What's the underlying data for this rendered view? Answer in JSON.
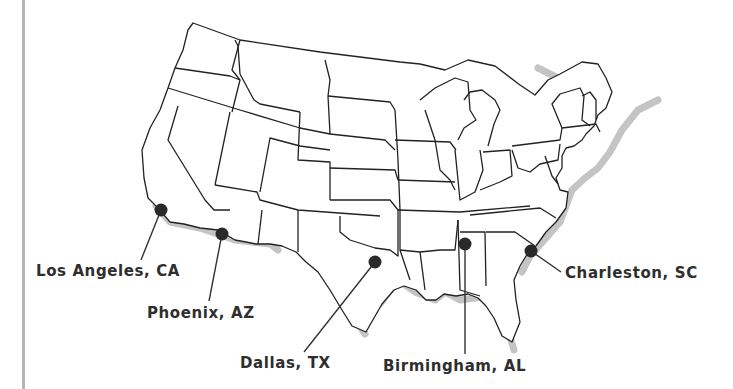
{
  "map": {
    "title": "United States",
    "colors": {
      "outline": "#222222",
      "shadow": "#bdbdbd",
      "dot": "#2a2a2a",
      "label": "#2e2e2e",
      "rule": "#b5b5b5"
    },
    "cities": [
      {
        "name": "Los Angeles, CA",
        "dot": [
          161,
          210
        ],
        "line_end": [
          141,
          260
        ],
        "label_pos": [
          36,
          262
        ]
      },
      {
        "name": "Phoenix, AZ",
        "dot": [
          222,
          234
        ],
        "line_end": [
          209,
          301
        ],
        "label_pos": [
          147,
          304
        ]
      },
      {
        "name": "Dallas, TX",
        "dot": [
          375,
          262
        ],
        "line_end": [
          304,
          352
        ],
        "label_pos": [
          240,
          353
        ]
      },
      {
        "name": "Birmingham, AL",
        "dot": [
          465,
          244
        ],
        "line_end": [
          465,
          354
        ],
        "label_pos": [
          383,
          357
        ]
      },
      {
        "name": "Charleston, SC",
        "dot": [
          531,
          251
        ],
        "line_end": [
          561,
          272
        ],
        "label_pos": [
          565,
          264
        ]
      }
    ]
  }
}
